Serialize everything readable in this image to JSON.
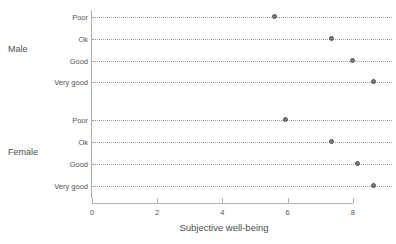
{
  "chart_data": {
    "type": "scatter",
    "title": "",
    "xlabel": "Subjective well-being",
    "ylabel": "",
    "xlim": [
      0,
      8.8
    ],
    "xticks": [
      0,
      2,
      4,
      6,
      8
    ],
    "xticklabels": [
      "0",
      "2",
      "4",
      "6",
      "8"
    ],
    "grid": "dotted-horizontal-rows",
    "legend": "none",
    "panels": [
      {
        "label": "Male",
        "categories": [
          "Poor",
          "Ok",
          "Good",
          "Very good"
        ],
        "values": [
          5.6,
          7.35,
          8.0,
          8.65
        ]
      },
      {
        "label": "Female",
        "categories": [
          "Poor",
          "Ok",
          "Good",
          "Very good"
        ],
        "values": [
          5.95,
          7.35,
          8.15,
          8.65
        ]
      }
    ]
  },
  "axis": {
    "x_title": "Subjective well-being",
    "x_tick_labels": [
      "0",
      "2",
      "4",
      "6",
      "8"
    ]
  },
  "panels": {
    "male": {
      "label": "Male",
      "rows": [
        {
          "label": "Poor",
          "value": 5.6
        },
        {
          "label": "Ok",
          "value": 7.35
        },
        {
          "label": "Good",
          "value": 8.0
        },
        {
          "label": "Very good",
          "value": 8.65
        }
      ]
    },
    "female": {
      "label": "Female",
      "rows": [
        {
          "label": "Poor",
          "value": 5.95
        },
        {
          "label": "Ok",
          "value": 7.35
        },
        {
          "label": "Good",
          "value": 8.15
        },
        {
          "label": "Very good",
          "value": 8.65
        }
      ]
    }
  },
  "colors": {
    "axis": "#b0b0b0",
    "gridline": "#9a9a9a",
    "marker_fill": "#7a7a7a",
    "marker_stroke": "#555555",
    "text": "#4d4d4d",
    "background": "#ffffff"
  }
}
